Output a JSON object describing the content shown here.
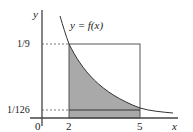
{
  "diagram": {
    "function_label": "y = f(x)",
    "y_axis_label": "y",
    "x_axis_label": "x",
    "y_ticks": [
      "1/9",
      "1/126"
    ],
    "x_ticks": [
      "0",
      "2",
      "5"
    ],
    "colors": {
      "shade": "#a9a9a9",
      "line": "#555555",
      "axis": "#444444"
    }
  }
}
